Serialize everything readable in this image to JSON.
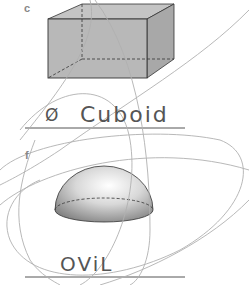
{
  "worksheet": {
    "items": [
      {
        "label": "c",
        "shape": "cuboid",
        "answer": "Cuboid",
        "crossed_mark": "Ø"
      },
      {
        "label": "f",
        "shape": "hemisphere",
        "answer": "OViL"
      }
    ]
  },
  "colors": {
    "shape_fill": "#b8b8b8",
    "shape_side": "#a8a8a8",
    "outline": "#333333",
    "scribble": "#b0b0b0",
    "answer_line": "#555555",
    "handwriting": "#555555",
    "label": "#888888"
  }
}
